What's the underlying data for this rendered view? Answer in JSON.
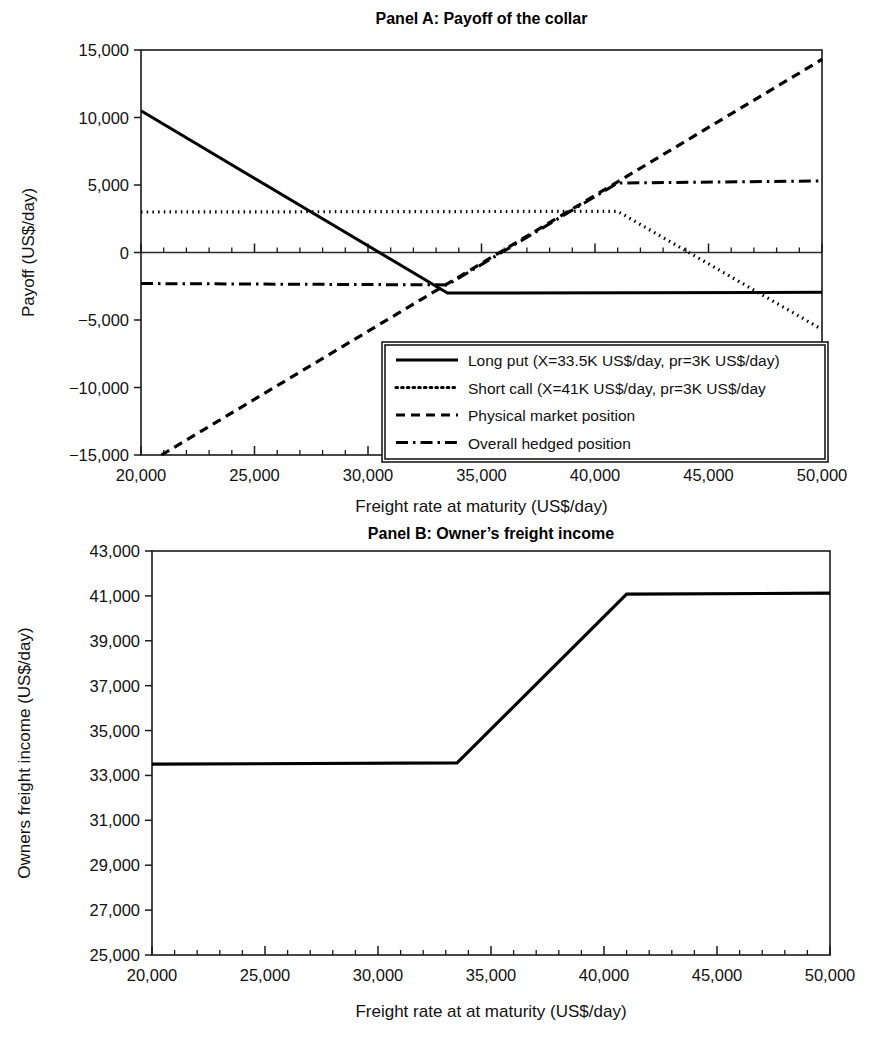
{
  "figure": {
    "background_color": "#ffffff",
    "line_color": "#000000"
  },
  "chart_data": [
    {
      "id": "panel-a",
      "type": "line",
      "title": "Panel A: Payoff of the collar",
      "xlabel": "Freight rate at maturity (US$/day)",
      "ylabel": "Payoff (US$/day)",
      "xlim": [
        20000,
        50000
      ],
      "ylim": [
        -15000,
        15000
      ],
      "xticks": [
        20000,
        25000,
        30000,
        35000,
        40000,
        45000,
        50000
      ],
      "xtick_labels": [
        "20,000",
        "25,000",
        "30,000",
        "35,000",
        "40,000",
        "45,000",
        "50,000"
      ],
      "yticks": [
        -15000,
        -10000,
        -5000,
        0,
        5000,
        10000,
        15000
      ],
      "ytick_labels": [
        "−15,000",
        "−10,000",
        "−5,000",
        "0",
        "5,000",
        "10,000",
        "15,000"
      ],
      "xminor_step": 1000,
      "grid": false,
      "zero_line": true,
      "legend_position": "lower center",
      "series": [
        {
          "name": "Long put (X=33.5K US$/day, pr=3K US$/day)",
          "style": "solid",
          "stroke_width": 3.0,
          "dasharray": "none",
          "x": [
            20000,
            33500,
            50000
          ],
          "y": [
            10500,
            -3000,
            -2950
          ]
        },
        {
          "name": "Short call (X=41K US$/day, pr=3K US$/day",
          "style": "dotted",
          "stroke_width": 3.2,
          "dasharray": "1.5 4.2",
          "x": [
            20000,
            41000,
            50000
          ],
          "y": [
            3000,
            3050,
            -5700
          ]
        },
        {
          "name": "Physical market position",
          "style": "dashed",
          "stroke_width": 3.2,
          "dasharray": "9 6",
          "x": [
            20900,
            50000
          ],
          "y": [
            -15000,
            14300
          ]
        },
        {
          "name": "Overall hedged position",
          "style": "dashdot",
          "stroke_width": 3.0,
          "dasharray": "12 5 2.5 5",
          "x": [
            20000,
            33500,
            41000,
            50000
          ],
          "y": [
            -2300,
            -2400,
            5150,
            5300
          ]
        }
      ]
    },
    {
      "id": "panel-b",
      "type": "line",
      "title": "Panel B: Owner’s freight income",
      "xlabel": "Freight rate at at maturity (US$/day)",
      "ylabel": "Owners freight income (US$/day)",
      "xlim": [
        20000,
        50000
      ],
      "ylim": [
        25000,
        43000
      ],
      "xticks": [
        20000,
        25000,
        30000,
        35000,
        40000,
        45000,
        50000
      ],
      "xtick_labels": [
        "20,000",
        "25,000",
        "30,000",
        "35,000",
        "40,000",
        "45,000",
        "50,000"
      ],
      "yticks": [
        25000,
        27000,
        29000,
        31000,
        33000,
        35000,
        37000,
        39000,
        41000,
        43000
      ],
      "ytick_labels": [
        "25,000",
        "27,000",
        "29,000",
        "31,000",
        "33,000",
        "35,000",
        "37,000",
        "39,000",
        "41,000",
        "43,000"
      ],
      "xminor_step": 1000,
      "grid": false,
      "zero_line": false,
      "legend_position": "none",
      "series": [
        {
          "name": "Owner's hedged freight income",
          "style": "solid",
          "stroke_width": 3.2,
          "dasharray": "none",
          "x": [
            20000,
            33500,
            41000,
            50000
          ],
          "y": [
            33500,
            33560,
            41080,
            41120
          ]
        }
      ]
    }
  ]
}
